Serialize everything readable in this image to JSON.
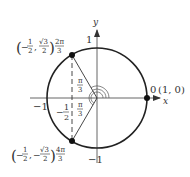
{
  "diagram": {
    "axes": {
      "x_label": "x",
      "y_label": "y",
      "tick_pos_y": "1",
      "tick_neg_y": "−1",
      "tick_neg_x": "−1"
    },
    "points": [
      {
        "name": "zero",
        "angle_label": "0",
        "coord_label": "(1, 0)"
      },
      {
        "name": "two-pi-over-three",
        "coord_open": "(",
        "coord_x_sign": "−",
        "coord_x_num": "1",
        "coord_x_den": "2",
        "coord_sep": ",",
        "coord_y_num": "√3",
        "coord_y_den": "2",
        "coord_close": ")",
        "angle_num": "2π",
        "angle_den": "3"
      },
      {
        "name": "four-pi-over-three",
        "coord_open": "(",
        "coord_x_sign": "−",
        "coord_x_num": "1",
        "coord_x_den": "2",
        "coord_sep": ",",
        "coord_y_sign": "−",
        "coord_y_num": "√3",
        "coord_y_den": "2",
        "coord_close": ")",
        "angle_num": "4π",
        "angle_den": "3"
      }
    ],
    "inner_angles": [
      {
        "num": "π",
        "den": "3"
      },
      {
        "num": "π",
        "den": "3"
      }
    ],
    "x_projection_label": {
      "sign": "−",
      "num": "1",
      "den": "2"
    },
    "colors": {
      "circle": "#222222",
      "axes": "#555555",
      "text": "#333333"
    }
  }
}
